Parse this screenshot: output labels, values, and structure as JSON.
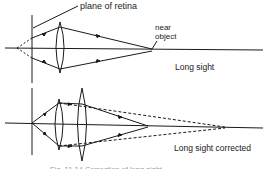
{
  "diagram": {
    "top": {
      "label_plane": "plane of retina",
      "label_near_1": "near",
      "label_near_2": "object",
      "caption": "Long sight"
    },
    "bottom": {
      "caption": "Long sight corrected"
    },
    "figure_caption": "Fig. 11.14  Correction of long sight",
    "colors": {
      "ink": "#1a1a1a",
      "background": "#ffffff"
    }
  }
}
